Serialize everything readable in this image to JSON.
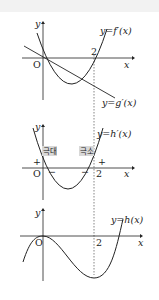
{
  "figure": {
    "panels": [
      {
        "id": "top",
        "y_axis_label": "y",
        "x_axis_label": "x",
        "origin_label": "O",
        "tick_label": "2",
        "curves": [
          {
            "name": "f-prime",
            "label": "y=f′(x)",
            "shape": "parabola"
          },
          {
            "name": "g-prime",
            "label": "y=g′(x)",
            "shape": "line"
          }
        ]
      },
      {
        "id": "middle",
        "y_axis_label": "y",
        "x_axis_label": "x",
        "origin_label": "O",
        "tick_label": "2",
        "curves": [
          {
            "name": "h-prime",
            "label": "y=h′(x)",
            "shape": "parabola"
          }
        ],
        "annotations": {
          "max_label": "극대",
          "min_label": "극소",
          "signs": [
            "+",
            "−",
            "−",
            "+"
          ]
        }
      },
      {
        "id": "bottom",
        "y_axis_label": "y",
        "x_axis_label": "x",
        "origin_label": "O",
        "tick_label": "2",
        "curves": [
          {
            "name": "h",
            "label": "y=h(x)",
            "shape": "cubic"
          }
        ]
      }
    ],
    "colors": {
      "stroke": "#222222",
      "badge": "#d8d8d8",
      "band": "#f2f2f2"
    }
  }
}
